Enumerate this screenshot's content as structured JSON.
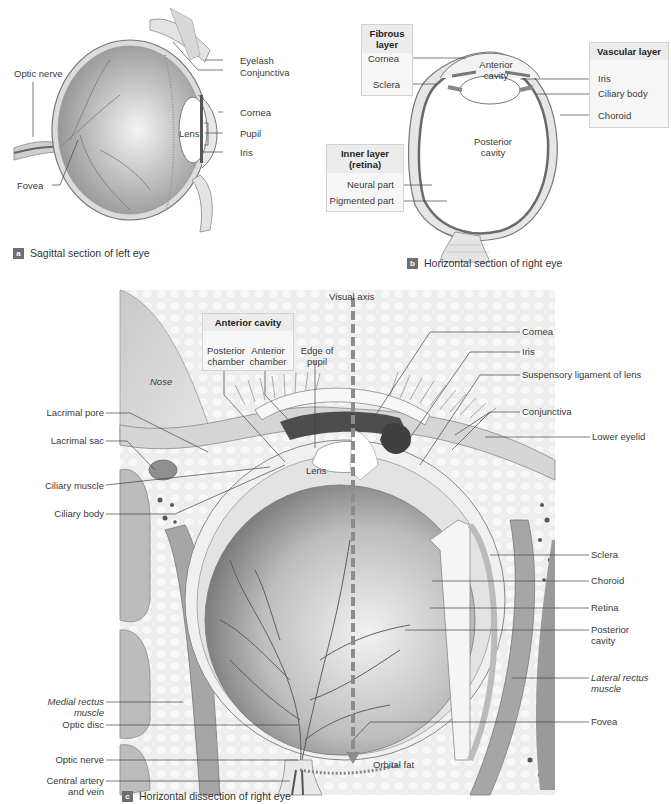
{
  "figure": {
    "panels": [
      {
        "id": "a",
        "caption": "Sagittal section of left eye",
        "labels": {
          "optic_nerve": "Optic nerve",
          "fovea": "Fovea",
          "eyelash": "Eyelash",
          "conjunctiva": "Conjunctiva",
          "cornea": "Cornea",
          "lens": "Lens",
          "pupil": "Pupil",
          "iris": "Iris"
        }
      },
      {
        "id": "b",
        "caption": "Horizontal section of right eye",
        "boxes": {
          "fibrous": {
            "title": "Fibrous layer",
            "items": [
              "Cornea",
              "Sclera"
            ]
          },
          "vascular": {
            "title": "Vascular layer",
            "items": [
              "Iris",
              "Ciliary body",
              "Choroid"
            ]
          },
          "inner": {
            "title": "Inner layer (retina)",
            "items": [
              "Neural part",
              "Pigmented part"
            ]
          }
        },
        "labels": {
          "anterior_cavity": "Anterior cavity",
          "posterior_cavity": "Posterior cavity"
        }
      },
      {
        "id": "c",
        "caption": "Horizontal dissection of right eye",
        "box": {
          "title": "Anterior cavity",
          "items": [
            "Posterior chamber",
            "Anterior chamber"
          ]
        },
        "labels": {
          "visual_axis": "Visual axis",
          "edge_of_pupil": "Edge of pupil",
          "nose": "Nose",
          "lens": "Lens",
          "orbital_fat": "Orbital fat",
          "left": [
            "Lacrimal pore",
            "Lacrimal sac",
            "Ciliary muscle",
            "Ciliary body",
            "Medial rectus muscle",
            "Optic disc",
            "Optic nerve",
            "Central artery and vein"
          ],
          "right": [
            "Cornea",
            "Iris",
            "Suspensory ligament of lens",
            "Conjunctiva",
            "Lower eyelid",
            "Sclera",
            "Choroid",
            "Retina",
            "Posterior cavity",
            "Lateral rectus muscle",
            "Fovea"
          ]
        }
      }
    ]
  }
}
